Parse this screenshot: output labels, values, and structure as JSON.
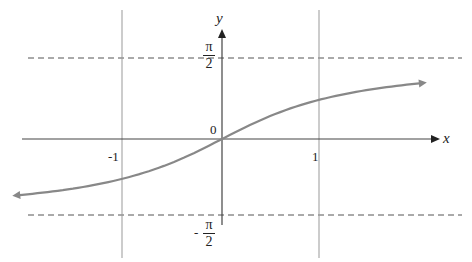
{
  "chart_data": {
    "type": "line",
    "title": "",
    "xlabel": "x",
    "ylabel": "y",
    "function": "y = arctan(x)",
    "x_ticks": [
      {
        "value": -1,
        "label": "-1"
      },
      {
        "value": 1,
        "label": "1"
      }
    ],
    "y_ticks": [
      {
        "value": 1.5708,
        "label_num": "π",
        "label_den": "2",
        "sign": ""
      },
      {
        "value": -1.5708,
        "label_num": "π",
        "label_den": "2",
        "sign": "-"
      }
    ],
    "origin_label": "0",
    "asymptotes": [
      1.5708,
      -1.5708
    ],
    "xlim": [
      -2.1,
      2.05
    ],
    "grid": false,
    "legend": null,
    "series": [
      {
        "name": "arctan",
        "color": "#888888",
        "x": [
          -2.1,
          -1.5,
          -1,
          -0.5,
          0,
          0.5,
          1,
          1.5,
          2.05
        ],
        "y": [
          -1.1442,
          -0.9828,
          -0.7854,
          -0.4636,
          0,
          0.4636,
          0.7854,
          0.9828,
          1.1177
        ]
      }
    ]
  },
  "labels": {
    "x_axis": "x",
    "y_axis": "y",
    "origin": "0",
    "tick_neg1": "-1",
    "tick_1": "1",
    "pi": "π",
    "two": "2",
    "minus": "-"
  }
}
